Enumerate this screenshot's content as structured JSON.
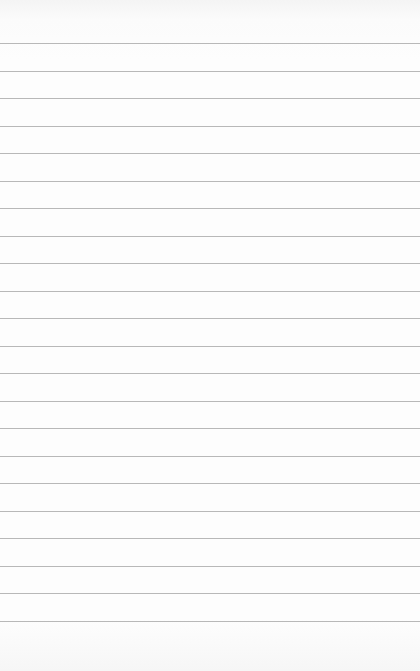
{
  "paper": {
    "type": "lined-paper",
    "line_color": "#b8b8b8",
    "background_color": "#fdfdfd",
    "line_count": 22,
    "first_line_y": 43,
    "line_spacing": 27.5
  }
}
